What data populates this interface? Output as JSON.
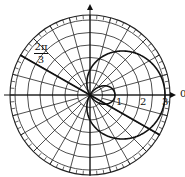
{
  "diagram": {
    "type": "polar-plot",
    "curve": "limacon with inner loop",
    "equation_shape": "r = 1 + 2cos(theta)",
    "radial_labels": [
      "1",
      "2",
      "3"
    ],
    "angle_label_numerator": "2π",
    "angle_label_denominator": "3",
    "axis_label_right": "0",
    "colors": {
      "ink": "#111111",
      "background": "#ffffff"
    }
  }
}
